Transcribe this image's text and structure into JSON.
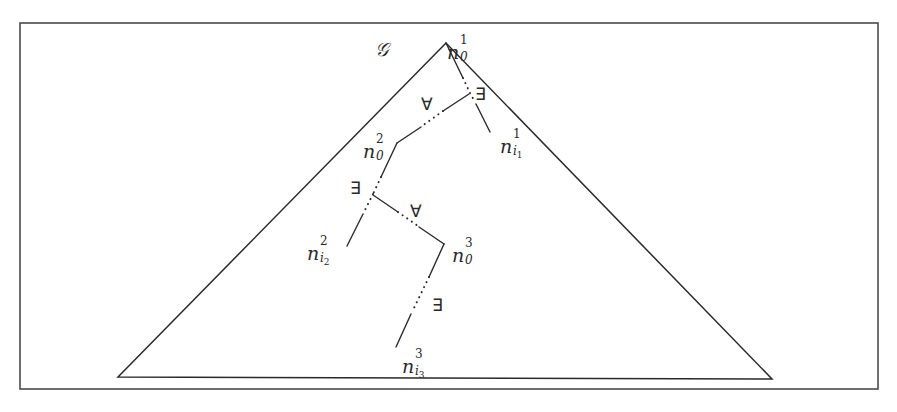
{
  "diagram": {
    "graph_label": "𝒢",
    "frame": {
      "x": 20,
      "y": 23,
      "width": 858,
      "height": 366
    },
    "triangle": {
      "apex": [
        446,
        43
      ],
      "bottom_left": [
        118,
        377
      ],
      "bottom_right": [
        772,
        379
      ]
    },
    "nodes": [
      {
        "id": "n0_1",
        "base": "n",
        "sup": "1",
        "sub": "0",
        "subsub": ""
      },
      {
        "id": "ni1_1",
        "base": "n",
        "sup": "1",
        "sub": "i",
        "subsub": "1"
      },
      {
        "id": "n0_2",
        "base": "n",
        "sup": "2",
        "sub": "0",
        "subsub": ""
      },
      {
        "id": "ni2_2",
        "base": "n",
        "sup": "2",
        "sub": "i",
        "subsub": "2"
      },
      {
        "id": "n0_3",
        "base": "n",
        "sup": "3",
        "sub": "0",
        "subsub": ""
      },
      {
        "id": "ni3_3",
        "base": "n",
        "sup": "3",
        "sub": "i",
        "subsub": "3"
      }
    ],
    "quantifiers": [
      {
        "symbol": "∃",
        "near": "junction-1"
      },
      {
        "symbol": "∀",
        "near": "path-1-to-2"
      },
      {
        "symbol": "∃",
        "near": "junction-2"
      },
      {
        "symbol": "∀",
        "near": "path-2-to-3"
      },
      {
        "symbol": "∃",
        "near": "path-3-to-leaf"
      }
    ],
    "colors": {
      "stroke": "#2a2a2a",
      "frame": "#4a4a4a",
      "background": "#ffffff"
    }
  }
}
